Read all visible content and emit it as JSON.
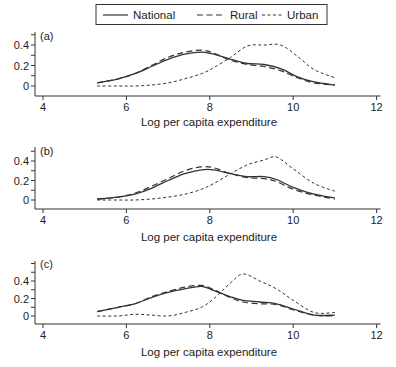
{
  "chart_data": {
    "type": "line",
    "legend": {
      "position": "top",
      "entries": [
        {
          "label": "National",
          "style": "solid"
        },
        {
          "label": "Rural",
          "style": "long-dash"
        },
        {
          "label": "Urban",
          "style": "short-dash"
        }
      ]
    },
    "xlabel": "Log per capita expenditure",
    "xlim": [
      4,
      12
    ],
    "xticks": [
      4,
      6,
      8,
      10,
      12
    ],
    "grid": false,
    "panels": [
      {
        "label": "(a)",
        "ylabel": "",
        "ylim": [
          0,
          0.5
        ],
        "yticks": [
          0,
          0.2,
          0.4
        ],
        "x": [
          5.3,
          5.8,
          6.2,
          6.6,
          7.0,
          7.4,
          7.8,
          8.1,
          8.5,
          8.9,
          9.3,
          9.7,
          10.1,
          10.5,
          11.0
        ],
        "series": [
          {
            "name": "National",
            "values": [
              0.03,
              0.07,
              0.12,
              0.19,
              0.26,
              0.31,
              0.33,
              0.31,
              0.26,
              0.22,
              0.21,
              0.17,
              0.09,
              0.04,
              0.01
            ]
          },
          {
            "name": "Rural",
            "values": [
              0.03,
              0.07,
              0.12,
              0.2,
              0.28,
              0.33,
              0.35,
              0.32,
              0.25,
              0.21,
              0.19,
              0.15,
              0.08,
              0.03,
              0.01
            ]
          },
          {
            "name": "Urban",
            "values": [
              0.0,
              0.0,
              0.0,
              0.01,
              0.03,
              0.07,
              0.12,
              0.18,
              0.28,
              0.39,
              0.4,
              0.4,
              0.29,
              0.16,
              0.08
            ]
          }
        ]
      },
      {
        "label": "(b)",
        "ylabel": "",
        "ylim": [
          0,
          0.5
        ],
        "yticks": [
          0,
          0.2,
          0.4
        ],
        "x": [
          5.3,
          5.8,
          6.2,
          6.6,
          7.0,
          7.4,
          7.8,
          8.1,
          8.5,
          8.9,
          9.3,
          9.6,
          10.0,
          10.5,
          11.0
        ],
        "series": [
          {
            "name": "National",
            "values": [
              0.01,
              0.03,
              0.06,
              0.12,
              0.2,
              0.27,
              0.31,
              0.31,
              0.27,
              0.24,
              0.24,
              0.21,
              0.13,
              0.06,
              0.02
            ]
          },
          {
            "name": "Rural",
            "values": [
              0.01,
              0.03,
              0.07,
              0.14,
              0.22,
              0.3,
              0.34,
              0.33,
              0.27,
              0.23,
              0.22,
              0.19,
              0.11,
              0.05,
              0.01
            ]
          },
          {
            "name": "Urban",
            "values": [
              0.0,
              0.0,
              0.0,
              0.01,
              0.03,
              0.06,
              0.11,
              0.17,
              0.27,
              0.36,
              0.41,
              0.44,
              0.32,
              0.17,
              0.09
            ]
          }
        ]
      },
      {
        "label": "(c)",
        "ylabel": "",
        "ylim": [
          0,
          0.6
        ],
        "yticks": [
          0,
          0.2,
          0.4
        ],
        "x": [
          5.3,
          5.8,
          6.2,
          6.6,
          7.0,
          7.4,
          7.8,
          8.1,
          8.5,
          8.8,
          9.2,
          9.6,
          10.0,
          10.5,
          11.0
        ],
        "series": [
          {
            "name": "National",
            "values": [
              0.05,
              0.1,
              0.14,
              0.21,
              0.27,
              0.31,
              0.34,
              0.29,
              0.22,
              0.18,
              0.16,
              0.14,
              0.08,
              0.01,
              0.01
            ]
          },
          {
            "name": "Rural",
            "values": [
              0.05,
              0.1,
              0.14,
              0.22,
              0.28,
              0.33,
              0.35,
              0.3,
              0.21,
              0.16,
              0.14,
              0.13,
              0.07,
              0.01,
              0.0
            ]
          },
          {
            "name": "Urban",
            "values": [
              0.0,
              0.0,
              0.02,
              0.01,
              0.0,
              0.04,
              0.1,
              0.2,
              0.38,
              0.48,
              0.4,
              0.31,
              0.18,
              0.04,
              0.04
            ]
          }
        ]
      }
    ]
  },
  "layout": {
    "line_color": "#333333",
    "axis_color": "#333333"
  }
}
